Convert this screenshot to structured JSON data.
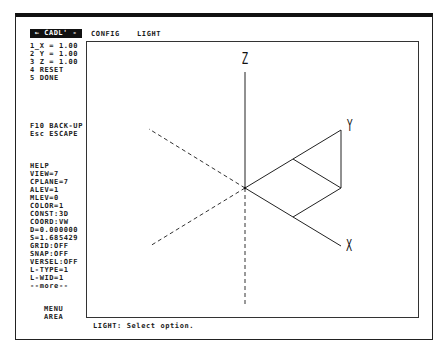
{
  "header": {
    "badge": "← CADL' -",
    "menus": [
      "CONFIG",
      "LIGHT"
    ]
  },
  "options": [
    "1_X = 1.00",
    "2 Y = 1.00",
    "3 Z = 1.00",
    "4 RESET",
    "5 DONE"
  ],
  "keys": [
    "F10 BACK-UP",
    "Esc ESCAPE"
  ],
  "status": [
    "HELP",
    "VIEW=7",
    "CPLANE=7",
    "ALEV=1",
    "MLEV=0",
    "COLOR=1",
    "CONST:3D",
    "COORD:VW",
    "D=0.000000",
    "S=1.685429",
    "GRID:OFF",
    "SNAP:OFF",
    "VERSEL:OFF",
    "L-TYPE=1",
    "L-WID=1",
    "--more--"
  ],
  "menu_area": [
    "MENU",
    "AREA"
  ],
  "prompt": "LIGHT: Select option.",
  "axes": {
    "x": "X",
    "y": "Y",
    "z": "Z"
  }
}
